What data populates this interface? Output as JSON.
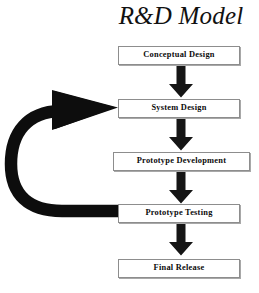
{
  "diagram": {
    "title": "R&D Model",
    "background_color": "#ffffff",
    "ink_color": "#0b0b0b",
    "box_border_color": "#8d8d8d",
    "type": "process-flowchart",
    "orientation": "top-to-bottom",
    "stages": [
      {
        "id": "conceptual-design",
        "label": "Conceptual Design",
        "order": 1
      },
      {
        "id": "system-design",
        "label": "System Design",
        "order": 2
      },
      {
        "id": "prototype-development",
        "label": "Prototype Development",
        "order": 3
      },
      {
        "id": "prototype-testing",
        "label": "Prototype Testing",
        "order": 4
      },
      {
        "id": "final-release",
        "label": "Final Release",
        "order": 5
      }
    ],
    "connectors": [
      {
        "id": "arrow-1",
        "kind": "down-arrow",
        "from": "conceptual-design",
        "to": "system-design"
      },
      {
        "id": "arrow-2",
        "kind": "down-arrow",
        "from": "system-design",
        "to": "prototype-development"
      },
      {
        "id": "arrow-3",
        "kind": "down-arrow",
        "from": "prototype-development",
        "to": "prototype-testing"
      },
      {
        "id": "arrow-4",
        "kind": "down-arrow",
        "from": "prototype-testing",
        "to": "final-release"
      },
      {
        "id": "loop-arrow",
        "kind": "curved-feedback-arrow",
        "from": "prototype-testing",
        "to": "system-design"
      }
    ]
  }
}
